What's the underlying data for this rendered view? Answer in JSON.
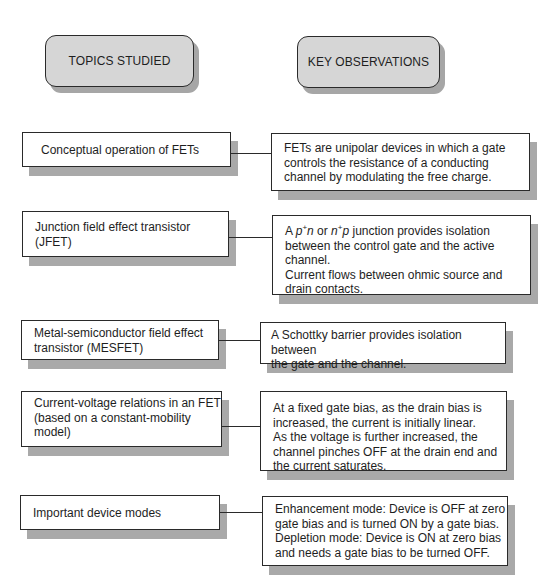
{
  "headers": {
    "topics": "TOPICS STUDIED",
    "observations": "KEY OBSERVATIONS"
  },
  "rows": [
    {
      "topic": "Conceptual operation of FETs",
      "observation": "FETs are unipolar devices in which a gate\ncontrols the resistance of a conducting\nchannel by modulating the free charge."
    },
    {
      "topic": "Junction field effect transistor\n(JFET)",
      "observation_parts": {
        "prefix": "A ",
        "term1_base": "p",
        "term1_sup": "+",
        "term1_tail": "n",
        "middle": " or ",
        "term2_base": "n",
        "term2_sup": "+",
        "term2_tail": "p",
        "suffix": " junction provides isolation",
        "rest": "between the control gate and the active\nchannel.\nCurrent flows between ohmic source and\ndrain contacts."
      }
    },
    {
      "topic": "Metal-semiconductor field effect\ntransistor (MESFET)",
      "observation": "A Schottky barrier provides isolation between\nthe gate and the channel."
    },
    {
      "topic": "Current-voltage relations in an FET\n(based on a constant-mobility\nmodel)",
      "observation": "At a fixed gate bias, as the drain bias is\nincreased, the current is initially linear.\nAs the voltage is further increased, the\nchannel pinches OFF at the drain end and\nthe current saturates."
    },
    {
      "topic": "Important device modes",
      "observation": "Enhancement mode: Device is OFF at zero\ngate bias and is turned ON by a gate bias.\nDepletion mode: Device is ON at zero bias\nand needs a gate bias to be turned OFF."
    }
  ],
  "colors": {
    "header_fill": "#d6d6d6",
    "shadow": "#a9a9a9",
    "border": "#2a2a2a"
  }
}
